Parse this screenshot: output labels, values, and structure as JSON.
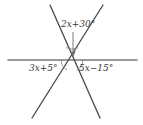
{
  "figure": {
    "type": "geometry-diagram",
    "width": 143,
    "height": 125,
    "background_color": "#ffffff"
  },
  "colors": {
    "horizontal_line": "#7a7a7a",
    "diagonal_line": "#474747",
    "arc": "#8a8a8a",
    "arrow": "#6e6e6e",
    "text": "#3a3a3a"
  },
  "labels": {
    "top_angle": {
      "text": "2x+30°",
      "var_coefficient": "2",
      "variable": "x",
      "operator": "+",
      "constant": "30",
      "unit": "°"
    },
    "left_angle": {
      "text": "3x+5°",
      "var_coefficient": "3",
      "variable": "x",
      "operator": "+",
      "constant": "5",
      "unit": "°"
    },
    "right_angle": {
      "text": "5x−15°",
      "var_coefficient": "5",
      "variable": "x",
      "operator": "−",
      "constant": "15",
      "unit": "°"
    }
  },
  "geometry": {
    "vertex": {
      "x": 72,
      "y": 60
    },
    "horizontal_line": {
      "x1": 8,
      "y1": 60,
      "x2": 137,
      "y2": 60
    },
    "diagonal_line_1": {
      "x1": 50,
      "y1": 5,
      "x2": 100,
      "y2": 118
    },
    "diagonal_line_2": {
      "x1": 103,
      "y1": 5,
      "x2": 32,
      "y2": 118
    },
    "arrow": {
      "x1": 73,
      "y1": 32,
      "x2": 73,
      "y2": 56
    },
    "arcs": [
      {
        "name": "top-angle-arc",
        "radius": 13
      },
      {
        "name": "left-angle-arc",
        "radius": 11
      },
      {
        "name": "right-angle-arc",
        "radius": 11
      }
    ]
  }
}
